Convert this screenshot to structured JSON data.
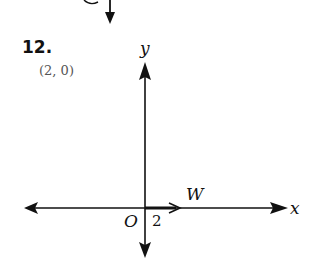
{
  "problem": {
    "number": "12.",
    "answer": "(2, 0)"
  },
  "graph": {
    "x_axis_label": "x",
    "y_axis_label": "y",
    "origin_label": "O",
    "tick_label": "2",
    "vector_label": "W",
    "vector": {
      "from": [
        0,
        0
      ],
      "to": [
        2,
        0
      ]
    }
  },
  "prev_fragment": {
    "partial_label": "O"
  },
  "colors": {
    "ink": "#111111",
    "answer_text": "#555555"
  }
}
